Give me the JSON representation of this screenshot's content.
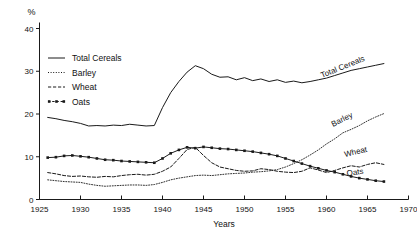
{
  "chart_data": {
    "type": "line",
    "title": "",
    "xlabel": "Years",
    "ylabel": "%",
    "yunit": "%",
    "xlim": [
      1925,
      1970
    ],
    "ylim": [
      0,
      40
    ],
    "xticks": [
      1925,
      1930,
      1935,
      1940,
      1945,
      1950,
      1955,
      1960,
      1965,
      1970
    ],
    "yticks": [
      0,
      10,
      20,
      30,
      40
    ],
    "grid": false,
    "legend_position": "upper-left",
    "series": [
      {
        "name": "Total Cereals",
        "style": "solid",
        "label_on_curve": "Total Cereals",
        "x": [
          1926,
          1927,
          1928,
          1929,
          1930,
          1931,
          1932,
          1933,
          1934,
          1935,
          1936,
          1937,
          1938,
          1939,
          1940,
          1941,
          1942,
          1943,
          1944,
          1945,
          1946,
          1947,
          1948,
          1949,
          1950,
          1951,
          1952,
          1953,
          1954,
          1955,
          1956,
          1957,
          1958,
          1959,
          1960,
          1961,
          1962,
          1963,
          1964,
          1965,
          1966,
          1967
        ],
        "values": [
          19.2,
          18.9,
          18.5,
          18.2,
          17.8,
          17.2,
          17.3,
          17.2,
          17.4,
          17.3,
          17.6,
          17.4,
          17.2,
          17.3,
          21.5,
          25.0,
          27.6,
          29.8,
          31.3,
          30.6,
          29.3,
          28.6,
          28.7,
          28.0,
          28.5,
          27.8,
          28.2,
          27.6,
          28.0,
          27.4,
          27.7,
          27.3,
          27.6,
          28.0,
          28.4,
          29.0,
          29.6,
          30.2,
          30.6,
          31.0,
          31.4,
          31.8
        ]
      },
      {
        "name": "Barley",
        "style": "dotted",
        "label_on_curve": "Barley",
        "x": [
          1926,
          1927,
          1928,
          1929,
          1930,
          1931,
          1932,
          1933,
          1934,
          1935,
          1936,
          1937,
          1938,
          1939,
          1940,
          1941,
          1942,
          1943,
          1944,
          1945,
          1946,
          1947,
          1948,
          1949,
          1950,
          1951,
          1952,
          1953,
          1954,
          1955,
          1956,
          1957,
          1958,
          1959,
          1960,
          1961,
          1962,
          1963,
          1964,
          1965,
          1966,
          1967
        ],
        "values": [
          4.6,
          4.4,
          4.2,
          4.1,
          4.0,
          3.6,
          3.3,
          3.1,
          3.2,
          3.3,
          3.4,
          3.4,
          3.3,
          3.5,
          4.0,
          4.6,
          5.0,
          5.3,
          5.6,
          5.7,
          5.6,
          5.8,
          6.0,
          6.1,
          6.2,
          6.4,
          6.5,
          6.7,
          7.0,
          7.6,
          8.4,
          9.3,
          10.4,
          11.6,
          13.0,
          14.2,
          15.6,
          16.4,
          17.3,
          18.4,
          19.3,
          20.1
        ]
      },
      {
        "name": "Wheat",
        "style": "dashed",
        "label_on_curve": "Wheat",
        "x": [
          1926,
          1927,
          1928,
          1929,
          1930,
          1931,
          1932,
          1933,
          1934,
          1935,
          1936,
          1937,
          1938,
          1939,
          1940,
          1941,
          1942,
          1943,
          1944,
          1945,
          1946,
          1947,
          1948,
          1949,
          1950,
          1951,
          1952,
          1953,
          1954,
          1955,
          1956,
          1957,
          1958,
          1959,
          1960,
          1961,
          1962,
          1963,
          1964,
          1965,
          1966,
          1967
        ],
        "values": [
          6.3,
          6.0,
          5.6,
          5.4,
          5.5,
          5.3,
          5.2,
          5.4,
          5.3,
          5.6,
          5.8,
          5.9,
          5.7,
          5.9,
          6.6,
          7.6,
          9.6,
          11.7,
          12.2,
          10.3,
          8.6,
          7.6,
          7.2,
          6.8,
          6.6,
          6.7,
          7.2,
          7.0,
          6.6,
          6.4,
          6.3,
          6.6,
          7.4,
          6.9,
          6.3,
          6.8,
          7.4,
          7.9,
          7.6,
          8.2,
          8.6,
          8.2
        ]
      },
      {
        "name": "Oats",
        "style": "dash-dot-marker",
        "label_on_curve": "Oats",
        "x": [
          1926,
          1927,
          1928,
          1929,
          1930,
          1931,
          1932,
          1933,
          1934,
          1935,
          1936,
          1937,
          1938,
          1939,
          1940,
          1941,
          1942,
          1943,
          1944,
          1945,
          1946,
          1947,
          1948,
          1949,
          1950,
          1951,
          1952,
          1953,
          1954,
          1955,
          1956,
          1957,
          1958,
          1959,
          1960,
          1961,
          1962,
          1963,
          1964,
          1965,
          1966,
          1967
        ],
        "values": [
          9.8,
          9.9,
          10.2,
          10.3,
          10.1,
          9.9,
          9.6,
          9.3,
          9.2,
          9.0,
          8.9,
          8.8,
          8.7,
          8.6,
          9.6,
          10.8,
          11.6,
          12.2,
          12.0,
          12.3,
          12.1,
          11.9,
          11.8,
          11.6,
          11.4,
          11.2,
          10.9,
          10.6,
          10.2,
          9.6,
          9.0,
          8.4,
          7.8,
          7.3,
          6.8,
          6.4,
          5.9,
          5.4,
          5.0,
          4.7,
          4.4,
          4.2
        ]
      }
    ]
  },
  "legend": {
    "items": [
      {
        "label": "Total Cereals",
        "style": "solid"
      },
      {
        "label": "Barley",
        "style": "dotted"
      },
      {
        "label": "Wheat",
        "style": "dashed"
      },
      {
        "label": "Oats",
        "style": "dash-dot-marker"
      }
    ]
  },
  "curve_labels": [
    {
      "text": "Total Cereals"
    },
    {
      "text": "Barley"
    },
    {
      "text": "Wheat"
    },
    {
      "text": "Oats"
    }
  ],
  "axes": {
    "y_unit": "%",
    "x_title": "Years",
    "x_tick_labels": [
      "1925",
      "1930",
      "1935",
      "1940",
      "1945",
      "1950",
      "1955",
      "1960",
      "1965",
      "1970"
    ],
    "y_tick_labels": [
      "0",
      "10",
      "20",
      "30",
      "40"
    ]
  },
  "colors": {
    "ink": "#1a1a1a",
    "background": "#ffffff"
  }
}
